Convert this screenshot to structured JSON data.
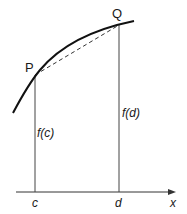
{
  "diagram": {
    "points": {
      "P": {
        "label": "P",
        "x": 35,
        "y": 75
      },
      "Q": {
        "label": "Q",
        "x": 119,
        "y": 25
      }
    },
    "curve": {
      "start": [
        13,
        113
      ],
      "end": [
        134,
        21
      ]
    },
    "chord": {
      "style": "dashed",
      "from": "P",
      "to": "Q"
    },
    "verticals": [
      {
        "x": 35,
        "label": "f(c)"
      },
      {
        "x": 119,
        "label": "f(d)"
      }
    ],
    "x_axis": {
      "label": "x",
      "ticks": [
        {
          "x": 35,
          "label": "c"
        },
        {
          "x": 119,
          "label": "d"
        }
      ]
    },
    "labels": {
      "P": "P",
      "Q": "Q",
      "fc": "f(c)",
      "fd": "f(d)",
      "c": "c",
      "d": "d",
      "x": "x"
    },
    "colors": {
      "stroke": "#1a1a1a",
      "thin": "#333333",
      "background": "#ffffff"
    }
  }
}
